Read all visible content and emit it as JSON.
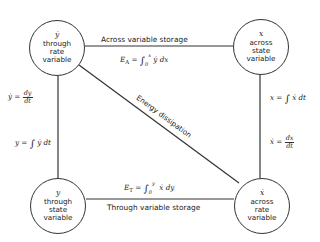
{
  "diagram": {
    "nodes": [
      {
        "id": "top-left",
        "symbol": "ẏ",
        "lines": [
          "through",
          "rate",
          "variable"
        ]
      },
      {
        "id": "top-right",
        "symbol": "x",
        "lines": [
          "across",
          "state",
          "variable"
        ]
      },
      {
        "id": "bottom-left",
        "symbol": "y",
        "lines": [
          "through",
          "state",
          "variable"
        ]
      },
      {
        "id": "bottom-right",
        "symbol": "ẋ",
        "lines": [
          "across",
          "rate",
          "variable"
        ]
      }
    ],
    "edges": {
      "top": {
        "label": "Across variable storage",
        "equation": {
          "lhs": "E",
          "sub": "A",
          "upper": "x",
          "lower": "0",
          "integrand": "ẏ dx"
        }
      },
      "bottom": {
        "label": "Through variable storage",
        "equation": {
          "lhs": "E",
          "sub": "T",
          "upper": "y",
          "lower": "0",
          "integrand": "ẋ dy"
        }
      },
      "diagonal": {
        "label": "Energy dissipation"
      },
      "left": {
        "equation_top": {
          "lhs": "ẏ",
          "num": "dy",
          "den": "dt"
        },
        "equation_bottom": {
          "lhs": "y",
          "integrand": "ẏ dt"
        }
      },
      "right": {
        "equation_top": {
          "lhs": "x",
          "integrand": "ẋ dt"
        },
        "equation_bottom": {
          "lhs": "ẋ",
          "num": "dx",
          "den": "dt"
        }
      }
    },
    "line_color": "#333333"
  }
}
